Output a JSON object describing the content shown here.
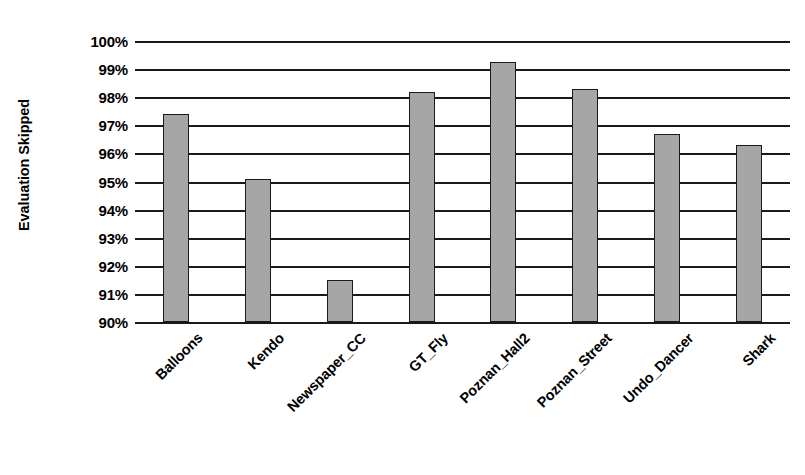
{
  "chart_data": {
    "type": "bar",
    "title": "",
    "xlabel": "",
    "ylabel": "Evaluation Skipped",
    "categories": [
      "Balloons",
      "Kendo",
      "Newspaper_CC",
      "GT_Fly",
      "Poznan_Hall2",
      "Poznan_Street",
      "Undo_Dancer",
      "Shark"
    ],
    "values": [
      97.4,
      95.1,
      91.5,
      98.2,
      99.25,
      98.3,
      96.7,
      96.3
    ],
    "value_labels": [
      "97.4%",
      "95.1%",
      "91.5%",
      "98.2%",
      "99.25%",
      "98.3%",
      "96.7%",
      "96.3%"
    ],
    "ylim": [
      90,
      100
    ],
    "ytick_values": [
      100,
      99,
      98,
      97,
      96,
      95,
      94,
      93,
      92,
      91,
      90
    ],
    "ytick_labels": [
      "100%",
      "99%",
      "98%",
      "97%",
      "96%",
      "95%",
      "94%",
      "93%",
      "92%",
      "91%",
      "90%"
    ],
    "grid": "horizontal",
    "legend": "none",
    "legend_position": "none",
    "series": [
      {
        "name": "Evaluation Skipped",
        "values": [
          97.4,
          95.1,
          91.5,
          98.2,
          99.25,
          98.3,
          96.7,
          96.3
        ]
      }
    ],
    "colors": {
      "bar_fill": "#a6a6a6",
      "bar_border": "#1a1a1a",
      "gridline": "#1a1a1a",
      "text": "#000000",
      "background": "#ffffff"
    }
  }
}
